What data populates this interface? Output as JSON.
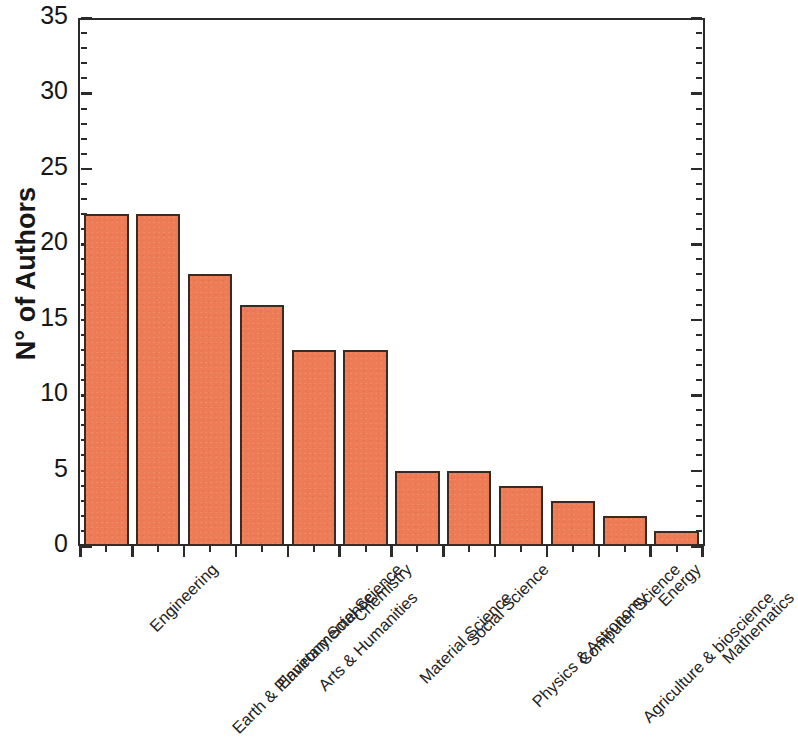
{
  "chart_data": {
    "type": "bar",
    "title": "",
    "subtitle": "",
    "xlabel": "",
    "ylabel": "N° of Authors",
    "ylim": [
      0,
      35
    ],
    "ytick_step": 5,
    "yticks": [
      "0",
      "5",
      "10",
      "15",
      "20",
      "25",
      "30",
      "35"
    ],
    "minor_ticks_per_major": 5,
    "grid": false,
    "legend": null,
    "bar_fill_color": "#ec7b56",
    "bar_edge_color": "#3a2a22",
    "axis_color": "#2b2b2b",
    "categories": [
      "Engineering",
      "Earth & Planetary Science",
      "Environmental Science",
      "Arts & Humanities",
      "Chemistry",
      "Material Science",
      "Social Science",
      "Physics &  Astronomy",
      "Computer Science",
      "Agriculture & bioscience",
      "Energy",
      "Mathematics"
    ],
    "values": [
      22,
      22,
      18,
      16,
      13,
      13,
      5,
      5,
      4,
      3,
      2,
      1
    ]
  }
}
